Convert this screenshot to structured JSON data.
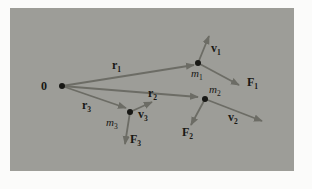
{
  "theme": {
    "paper": "#fbfbfa",
    "panel": "#9d9d98",
    "arrow": "#6c6c65",
    "ink": "#181815"
  },
  "diagram": {
    "dots": {
      "origin": {
        "cx": 62,
        "cy": 86
      },
      "m1": {
        "cx": 198,
        "cy": 63
      },
      "m2": {
        "cx": 205,
        "cy": 99
      },
      "m3": {
        "cx": 130,
        "cy": 112
      }
    },
    "arrows": {
      "r1": {
        "x1": 62,
        "y1": 86,
        "x2": 194,
        "y2": 65
      },
      "r2": {
        "x1": 62,
        "y1": 86,
        "x2": 198,
        "y2": 97
      },
      "r3": {
        "x1": 62,
        "y1": 86,
        "x2": 126,
        "y2": 108
      },
      "v1": {
        "x1": 198,
        "y1": 63,
        "x2": 209,
        "y2": 36
      },
      "f1": {
        "x1": 198,
        "y1": 63,
        "x2": 239,
        "y2": 85
      },
      "v2": {
        "x1": 205,
        "y1": 99,
        "x2": 262,
        "y2": 121
      },
      "f2": {
        "x1": 205,
        "y1": 99,
        "x2": 191,
        "y2": 125
      },
      "v3": {
        "x1": 130,
        "y1": 112,
        "x2": 152,
        "y2": 102
      },
      "f3": {
        "x1": 130,
        "y1": 112,
        "x2": 125,
        "y2": 144
      }
    },
    "labels": {
      "origin": {
        "x": 41,
        "y": 90,
        "main": "0"
      },
      "r1": {
        "x": 112,
        "y": 69,
        "main": "r",
        "sub": "1"
      },
      "r2": {
        "x": 148,
        "y": 97,
        "main": "r",
        "sub": "2"
      },
      "r3": {
        "x": 82,
        "y": 109,
        "main": "r",
        "sub": "3"
      },
      "v1": {
        "x": 211,
        "y": 52,
        "main": "v",
        "sub": "1"
      },
      "f1": {
        "x": 247,
        "y": 86,
        "main": "F",
        "sub": "1"
      },
      "v2": {
        "x": 228,
        "y": 121,
        "main": "v",
        "sub": "2"
      },
      "f2": {
        "x": 182,
        "y": 136,
        "main": "F",
        "sub": "2"
      },
      "v3": {
        "x": 138,
        "y": 118,
        "main": "v",
        "sub": "3"
      },
      "f3": {
        "x": 130,
        "y": 143,
        "main": "F",
        "sub": "3"
      },
      "m1": {
        "x": 191,
        "y": 77,
        "main": "m",
        "sub": "1"
      },
      "m2": {
        "x": 209,
        "y": 93,
        "main": "m",
        "sub": "2"
      },
      "m3": {
        "x": 106,
        "y": 126,
        "main": "m",
        "sub": "3"
      }
    }
  }
}
